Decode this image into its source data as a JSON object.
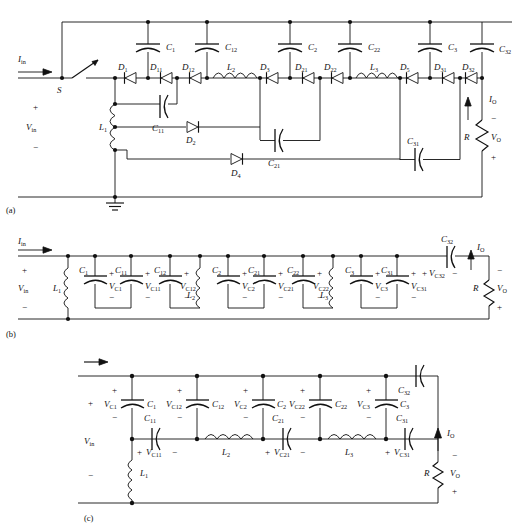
{
  "figure": {
    "panels": [
      {
        "id": "a",
        "caption": "(a)"
      },
      {
        "id": "b",
        "caption": "(b)"
      },
      {
        "id": "c",
        "caption": "(c)"
      }
    ]
  },
  "panel_a": {
    "caption": "(a)",
    "source": {
      "current": "I",
      "current_sub": "in",
      "voltage": "V",
      "voltage_sub": "in",
      "plus": "+",
      "minus": "−"
    },
    "switch": {
      "label": "S"
    },
    "ground": {
      "name": "ground-symbol"
    },
    "output": {
      "current": "I",
      "current_sub": "O",
      "voltage": "V",
      "voltage_sub": "O",
      "resistor": "R",
      "minus": "−",
      "plus": "+"
    },
    "inductors": [
      {
        "label": "L",
        "sub": "1"
      },
      {
        "label": "L",
        "sub": "2"
      },
      {
        "label": "L",
        "sub": "3"
      }
    ],
    "capacitors": [
      {
        "label": "C",
        "sub": "1"
      },
      {
        "label": "C",
        "sub": "12"
      },
      {
        "label": "C",
        "sub": "2"
      },
      {
        "label": "C",
        "sub": "22"
      },
      {
        "label": "C",
        "sub": "3"
      },
      {
        "label": "C",
        "sub": "32"
      },
      {
        "label": "C",
        "sub": "11"
      },
      {
        "label": "C",
        "sub": "21"
      },
      {
        "label": "C",
        "sub": "31"
      }
    ],
    "diodes": [
      {
        "label": "D",
        "sub": "1"
      },
      {
        "label": "D",
        "sub": "11"
      },
      {
        "label": "D",
        "sub": "12"
      },
      {
        "label": "D",
        "sub": "3"
      },
      {
        "label": "D",
        "sub": "21"
      },
      {
        "label": "D",
        "sub": "22"
      },
      {
        "label": "D",
        "sub": "5"
      },
      {
        "label": "D",
        "sub": "31"
      },
      {
        "label": "D",
        "sub": "32"
      },
      {
        "label": "D",
        "sub": "2"
      },
      {
        "label": "D",
        "sub": "4"
      }
    ]
  },
  "panel_b": {
    "caption": "(b)",
    "source": {
      "current": "I",
      "current_sub": "in",
      "voltage": "V",
      "voltage_sub": "in",
      "plus": "+",
      "minus": "−"
    },
    "output": {
      "current": "I",
      "current_sub": "O",
      "voltage": "V",
      "voltage_sub": "O",
      "resistor": "R",
      "minus": "−",
      "plus": "+"
    },
    "inductors": [
      {
        "label": "L",
        "sub": "1"
      },
      {
        "label": "L",
        "sub": "2"
      },
      {
        "label": "L",
        "sub": "3"
      }
    ],
    "capacitors": [
      {
        "label": "C",
        "sub": "1",
        "v": "V",
        "v_sub": "C1"
      },
      {
        "label": "C",
        "sub": "11",
        "v": "V",
        "v_sub": "C11"
      },
      {
        "label": "C",
        "sub": "12",
        "v": "V",
        "v_sub": "C12"
      },
      {
        "label": "C",
        "sub": "2",
        "v": "V",
        "v_sub": "C2"
      },
      {
        "label": "C",
        "sub": "21",
        "v": "V",
        "v_sub": "C21"
      },
      {
        "label": "C",
        "sub": "22",
        "v": "V",
        "v_sub": "C22"
      },
      {
        "label": "C",
        "sub": "3",
        "v": "V",
        "v_sub": "C3"
      },
      {
        "label": "C",
        "sub": "31",
        "v": "V",
        "v_sub": "C31"
      },
      {
        "label": "C",
        "sub": "32",
        "v": "V",
        "v_sub": "C32"
      }
    ],
    "signs": {
      "plus": "+",
      "minus": "−"
    }
  },
  "panel_c": {
    "caption": "(c)",
    "source": {
      "voltage": "V",
      "voltage_sub": "in",
      "plus": "+",
      "minus": "−"
    },
    "output": {
      "current": "I",
      "current_sub": "O",
      "voltage": "V",
      "voltage_sub": "O",
      "resistor": "R",
      "minus": "−",
      "plus": "+"
    },
    "inductors": [
      {
        "label": "L",
        "sub": "1"
      },
      {
        "label": "L",
        "sub": "2"
      },
      {
        "label": "L",
        "sub": "3"
      }
    ],
    "capacitors": [
      {
        "label": "C",
        "sub": "1",
        "v": "V",
        "v_sub": "C1"
      },
      {
        "label": "C",
        "sub": "12",
        "v": "V",
        "v_sub": "C12"
      },
      {
        "label": "C",
        "sub": "2",
        "v": "V",
        "v_sub": "C2"
      },
      {
        "label": "C",
        "sub": "22",
        "v": "V",
        "v_sub": "C22"
      },
      {
        "label": "C",
        "sub": "3",
        "v": "V",
        "v_sub": "C3"
      },
      {
        "label": "C",
        "sub": "32",
        "v": "",
        "v_sub": ""
      },
      {
        "label": "C",
        "sub": "11",
        "v": "V",
        "v_sub": "C11"
      },
      {
        "label": "C",
        "sub": "21",
        "v": "V",
        "v_sub": "C21"
      },
      {
        "label": "C",
        "sub": "31",
        "v": "V",
        "v_sub": "C31"
      }
    ],
    "signs": {
      "plus": "+",
      "minus": "−"
    }
  },
  "colors": {
    "line": "#111111",
    "background": "#ffffff"
  }
}
